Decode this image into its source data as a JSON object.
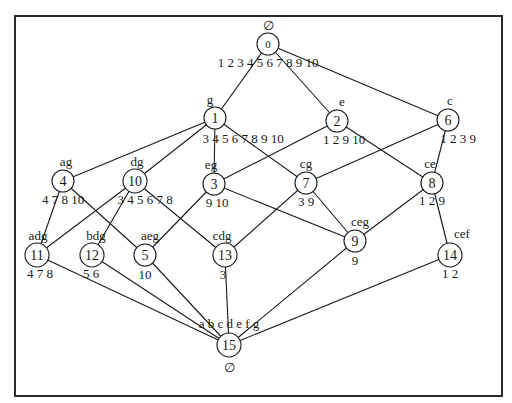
{
  "diagram": {
    "type": "concept-lattice",
    "nodes": [
      {
        "id": "0",
        "intent": "∅",
        "extent": "1 2 3 4 5 6 7 8 9 10"
      },
      {
        "id": "1",
        "intent": "g",
        "extent": "3 4 5 6 7 8 9 10"
      },
      {
        "id": "2",
        "intent": "e",
        "extent": "1 2 9 10"
      },
      {
        "id": "6",
        "intent": "c",
        "extent": "1 2 3 9"
      },
      {
        "id": "4",
        "intent": "ag",
        "extent": "4 7 8 10"
      },
      {
        "id": "10",
        "intent": "dg",
        "extent": "3 4 5 6 7 8"
      },
      {
        "id": "3",
        "intent": "eg",
        "extent": "9 10"
      },
      {
        "id": "7",
        "intent": "cg",
        "extent": "3 9"
      },
      {
        "id": "8",
        "intent": "ce",
        "extent": "1 2 9"
      },
      {
        "id": "11",
        "intent": "adg",
        "extent": "4 7 8"
      },
      {
        "id": "12",
        "intent": "bdg",
        "extent": "5 6"
      },
      {
        "id": "5",
        "intent": "aeg",
        "extent": "10"
      },
      {
        "id": "13",
        "intent": "cdg",
        "extent": "3"
      },
      {
        "id": "9",
        "intent": "ceg",
        "extent": "9"
      },
      {
        "id": "14",
        "intent": "cef",
        "extent": "1 2"
      },
      {
        "id": "15",
        "intent": "a b c d e f g",
        "extent": "∅"
      }
    ],
    "edges": [
      [
        "0",
        "1"
      ],
      [
        "0",
        "2"
      ],
      [
        "0",
        "6"
      ],
      [
        "1",
        "4"
      ],
      [
        "1",
        "10"
      ],
      [
        "1",
        "3"
      ],
      [
        "1",
        "7"
      ],
      [
        "2",
        "3"
      ],
      [
        "2",
        "8"
      ],
      [
        "6",
        "7"
      ],
      [
        "6",
        "8"
      ],
      [
        "4",
        "11"
      ],
      [
        "4",
        "5"
      ],
      [
        "10",
        "11"
      ],
      [
        "10",
        "12"
      ],
      [
        "10",
        "13"
      ],
      [
        "3",
        "5"
      ],
      [
        "3",
        "9"
      ],
      [
        "7",
        "13"
      ],
      [
        "7",
        "9"
      ],
      [
        "8",
        "9"
      ],
      [
        "8",
        "14"
      ],
      [
        "11",
        "15"
      ],
      [
        "12",
        "15"
      ],
      [
        "5",
        "15"
      ],
      [
        "13",
        "15"
      ],
      [
        "9",
        "15"
      ],
      [
        "14",
        "15"
      ]
    ]
  }
}
